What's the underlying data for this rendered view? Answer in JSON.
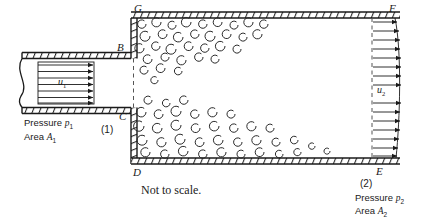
{
  "figure": {
    "title_note": "Not to scale.",
    "type": "sudden-expansion-pipe-flow-diagram",
    "stroke_color": "#1a1a1a",
    "background_color": "#ffffff"
  },
  "points": {
    "G": "G",
    "B": "B",
    "C": "C",
    "D": "D",
    "F": "F",
    "E": "E"
  },
  "sections": {
    "one": "(1)",
    "two": "(2)"
  },
  "velocities": {
    "inlet_symbol": "u",
    "inlet_sub": "1",
    "outlet_symbol": "u",
    "outlet_sub": "2"
  },
  "annotations": {
    "inlet_pressure_label": "Pressure",
    "inlet_pressure_symbol": "p",
    "inlet_pressure_sub": "1",
    "inlet_area_label": "Area",
    "inlet_area_symbol": "A",
    "inlet_area_sub": "1",
    "outlet_pressure_label": "Pressure",
    "outlet_pressure_symbol": "p",
    "outlet_pressure_sub": "2",
    "outlet_area_label": "Area",
    "outlet_area_symbol": "A",
    "outlet_area_sub": "2"
  },
  "geometry": {
    "small_pipe_top_y": 58,
    "small_pipe_bottom_y": 108,
    "large_duct_top_y": 18,
    "large_duct_bottom_y": 158,
    "expansion_x": 131,
    "exit_plane_x": 395,
    "inlet_profile_arrows": 7,
    "outlet_profile_arrows": 15
  }
}
